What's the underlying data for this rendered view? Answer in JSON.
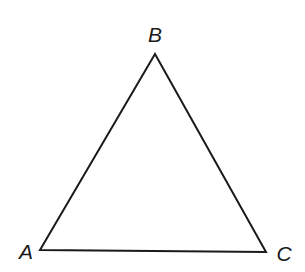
{
  "diagram": {
    "type": "triangle",
    "stroke_color": "#1a1a1a",
    "vertices": [
      {
        "label": "A",
        "x": 40,
        "y": 250,
        "label_x": 26,
        "label_y": 259
      },
      {
        "label": "B",
        "x": 155,
        "y": 54,
        "label_x": 155,
        "label_y": 42
      },
      {
        "label": "C",
        "x": 266,
        "y": 252,
        "label_x": 284,
        "label_y": 261
      }
    ]
  }
}
